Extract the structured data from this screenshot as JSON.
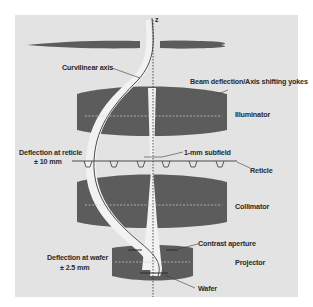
{
  "figure": {
    "type": "schematic",
    "colors": {
      "page_background": "#ffffff",
      "panel_background": "#e3e3e3",
      "lens_fill": "#5c5c5c",
      "beam_fill": "#f2f2f2",
      "axis_line": "#3a3a3a",
      "text": "#2a2a2a"
    },
    "axis_label": "z",
    "labels": {
      "curvilinear_axis": "Curvilinear axis",
      "yokes": "Beam deflection/Axis shifting yokes",
      "illuminator": "Illuminator",
      "deflection_reticle_line1": "Deflection at reticle",
      "deflection_reticle_line2": "± 10 mm",
      "subfield": "1-mm subfield",
      "reticle": "Reticle",
      "collimator": "Collimator",
      "contrast_aperture": "Contrast aperture",
      "deflection_wafer_line1": "Deflection at wafer",
      "deflection_wafer_line2": "± 2.5 mm",
      "projector": "Projector",
      "wafer": "Wafer"
    },
    "components": [
      {
        "name": "Condenser/top lens (thin)",
        "order": 1
      },
      {
        "name": "Illuminator",
        "order": 2
      },
      {
        "name": "Reticle",
        "order": 3
      },
      {
        "name": "Collimator",
        "order": 4
      },
      {
        "name": "Projector",
        "order": 5
      },
      {
        "name": "Wafer",
        "order": 6
      }
    ]
  }
}
